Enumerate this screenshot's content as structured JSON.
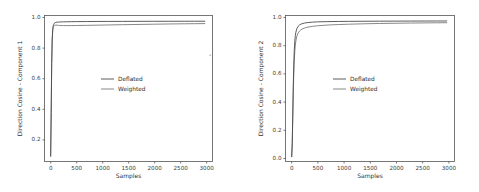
{
  "chart_data": [
    {
      "type": "line",
      "panel": "left",
      "title": "",
      "xlabel": "Samples",
      "ylabel": "Direction Cosine - Component 1",
      "xlim": [
        -120,
        3150
      ],
      "ylim": [
        0.08,
        1.035
      ],
      "xticks": [
        0,
        500,
        1000,
        1500,
        2000,
        2500,
        3000
      ],
      "xticklabels": [
        "0",
        "500",
        "1000",
        "1500",
        "2000",
        "2500",
        "3000"
      ],
      "yticks": [
        0.2,
        0.4,
        0.6,
        0.8,
        1.0
      ],
      "yticklabels": [
        "0.2",
        "0.4",
        "0.6",
        "0.8",
        "1.0"
      ],
      "grid": false,
      "legend_position": "center",
      "x": [
        0,
        10,
        20,
        30,
        40,
        50,
        60,
        70,
        80,
        100,
        125,
        150,
        175,
        200,
        250,
        300,
        400,
        500,
        700,
        900,
        1100,
        1400,
        1700,
        2000,
        2300,
        2600,
        2800,
        3000
      ],
      "series": [
        {
          "name": "Deflated",
          "color": "#4b4b4b",
          "values": [
            0.115,
            0.4,
            0.72,
            0.88,
            0.945,
            0.968,
            0.978,
            0.984,
            0.987,
            0.99,
            0.9915,
            0.992,
            0.9925,
            0.993,
            0.9935,
            0.994,
            0.9945,
            0.995,
            0.9955,
            0.996,
            0.9962,
            0.9965,
            0.9968,
            0.997,
            0.9972,
            0.9974,
            0.9975,
            0.9976
          ]
        },
        {
          "name": "Weighted",
          "color": "#7a7a7a",
          "values": [
            0.115,
            0.4,
            0.72,
            0.875,
            0.935,
            0.957,
            0.966,
            0.97,
            0.9715,
            0.972,
            0.9715,
            0.9705,
            0.97,
            0.9695,
            0.969,
            0.9688,
            0.969,
            0.9695,
            0.9705,
            0.9718,
            0.973,
            0.9748,
            0.9765,
            0.978,
            0.9795,
            0.9808,
            0.9815,
            0.982
          ]
        }
      ]
    },
    {
      "type": "line",
      "panel": "right",
      "title": "",
      "xlabel": "Samples",
      "ylabel": "Direction Cosine - Component 2",
      "xlim": [
        -120,
        3150
      ],
      "ylim": [
        -0.03,
        1.035
      ],
      "xticks": [
        0,
        500,
        1000,
        1500,
        2000,
        2500,
        3000
      ],
      "xticklabels": [
        "0",
        "500",
        "1000",
        "1500",
        "2000",
        "2500",
        "3000"
      ],
      "yticks": [
        0.0,
        0.2,
        0.4,
        0.6,
        0.8,
        1.0
      ],
      "yticklabels": [
        "0.0",
        "0.2",
        "0.4",
        "0.6",
        "0.8",
        "1.0"
      ],
      "grid": false,
      "legend_position": "center",
      "x": [
        0,
        10,
        20,
        30,
        40,
        50,
        60,
        70,
        80,
        100,
        125,
        150,
        175,
        200,
        250,
        300,
        400,
        500,
        700,
        900,
        1100,
        1400,
        1700,
        2000,
        2300,
        2600,
        2800,
        3000
      ],
      "series": [
        {
          "name": "Deflated",
          "color": "#4b4b4b",
          "values": [
            0.005,
            0.1,
            0.3,
            0.52,
            0.68,
            0.785,
            0.848,
            0.888,
            0.912,
            0.94,
            0.957,
            0.966,
            0.971,
            0.975,
            0.98,
            0.983,
            0.9865,
            0.9885,
            0.9905,
            0.9915,
            0.9922,
            0.993,
            0.9936,
            0.994,
            0.9944,
            0.9947,
            0.9949,
            0.995
          ]
        },
        {
          "name": "Weighted",
          "color": "#7a7a7a",
          "values": [
            0.005,
            0.09,
            0.27,
            0.46,
            0.605,
            0.705,
            0.772,
            0.818,
            0.848,
            0.885,
            0.908,
            0.921,
            0.93,
            0.936,
            0.944,
            0.949,
            0.956,
            0.96,
            0.9655,
            0.969,
            0.9715,
            0.9745,
            0.9768,
            0.9785,
            0.98,
            0.9812,
            0.9818,
            0.9825
          ]
        }
      ]
    }
  ],
  "panels": {
    "left": {
      "ylabel": "Direction Cosine - Component 1",
      "xlabel": "Samples",
      "yticklabels": [
        "1.0",
        "0.8",
        "0.6",
        "0.4",
        "0.2"
      ],
      "xticklabels": [
        "0",
        "500",
        "1000",
        "1500",
        "2000",
        "2500",
        "3000"
      ],
      "legend": [
        "Deflated",
        "Weighted"
      ]
    },
    "right": {
      "ylabel": "Direction Cosine - Component 2",
      "xlabel": "Samples",
      "yticklabels": [
        "1.0",
        "0.8",
        "0.6",
        "0.4",
        "0.2",
        "0.0"
      ],
      "xticklabels": [
        "0",
        "500",
        "1000",
        "1500",
        "2000",
        "2500",
        "3000"
      ],
      "legend": [
        "Deflated",
        "Weighted"
      ]
    }
  },
  "colors": {
    "deflated": "#4b4b4b",
    "weighted": "#7a7a7a",
    "axis": "#555555",
    "background": "#ffffff"
  }
}
